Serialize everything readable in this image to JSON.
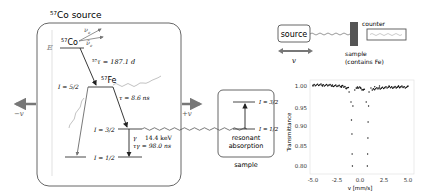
{
  "source_box": {
    "title_sup": "57",
    "title": "Co source",
    "energy_axis_label": "E",
    "co_label_sup": "57",
    "co_label": "Co",
    "nu_label": "ν",
    "nu_sub": "e",
    "nubar_label": "ν̄",
    "nubar_sub": "e",
    "halflife_sup": "57",
    "halflife": "τ = 187.1 d",
    "fe_label_sup": "57",
    "fe_label": "Fe",
    "level_52": "I = 5/2",
    "tau_52": "τ = 8.6 ns",
    "level_32": "I = 3/2",
    "level_12": "I = 1/2",
    "gamma_label": "γ",
    "gamma_energy": "14.4 keV",
    "gamma_tau": "τγ = 98.0 ns"
  },
  "motion": {
    "minus_v": "−v",
    "plus_v": "+v"
  },
  "absorber_box": {
    "level_32": "I = 3/2",
    "level_12": "I = 1/2",
    "line1": "resonant",
    "line2": "absorption",
    "caption": "sample"
  },
  "setup": {
    "source_label": "source",
    "velocity_label": "v",
    "sample_label_1": "sample",
    "sample_label_2": "(contains Fe)",
    "counter_label": "counter"
  },
  "chart_data": {
    "type": "scatter",
    "title": "",
    "xlabel": "v [mm/s]",
    "ylabel": "Transmittance",
    "xlim": [
      -5.0,
      5.0
    ],
    "ylim": [
      0.79,
      1.01
    ],
    "xticks": [
      "-5.0",
      "-2.5",
      "0.0",
      "2.5",
      "5.0"
    ],
    "yticks": [
      "1.00",
      "0.95",
      "0.90",
      "0.85",
      "0.80"
    ],
    "grid": false,
    "legend": "none",
    "x": [
      -5.0,
      -4.0,
      -3.0,
      -2.0,
      -1.5,
      -1.2,
      -1.0,
      -0.95,
      -0.9,
      -0.88,
      -0.85,
      -0.8,
      -0.6,
      -0.3,
      0.0,
      0.3,
      0.6,
      0.72,
      0.75,
      0.78,
      0.8,
      0.85,
      0.9,
      1.1,
      1.5,
      2.0,
      3.0,
      4.0,
      5.0
    ],
    "y": [
      1.0,
      1.0,
      0.999,
      0.997,
      0.993,
      0.985,
      0.96,
      0.915,
      0.88,
      0.83,
      0.8,
      0.95,
      0.99,
      0.995,
      0.996,
      0.99,
      0.96,
      0.8,
      0.83,
      0.87,
      0.91,
      0.95,
      0.985,
      0.995,
      0.998,
      1.0,
      1.0,
      1.0,
      1.0
    ]
  }
}
